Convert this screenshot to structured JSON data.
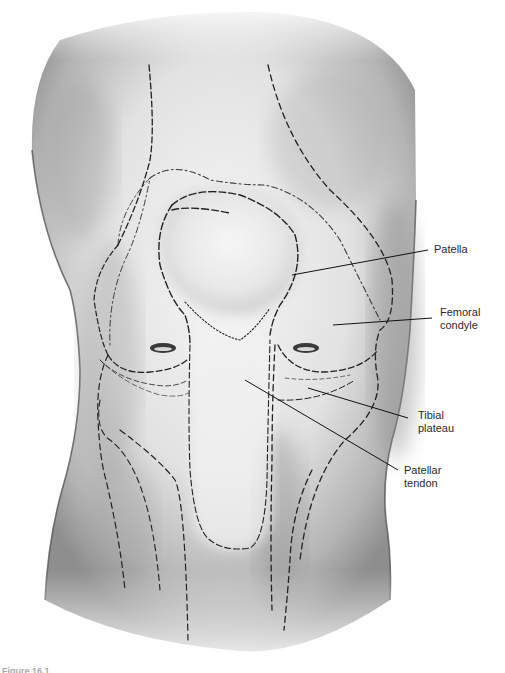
{
  "figure": {
    "caption_partial": "Figure 16.1"
  },
  "labels": [
    {
      "id": "patella",
      "text": "Patella"
    },
    {
      "id": "femoral-condyle",
      "text": "Femoral\ncondyle"
    },
    {
      "id": "tibial-plateau",
      "text": "Tibial\nplateau"
    },
    {
      "id": "patellar-tendon",
      "text": "Patellar\ntendon"
    }
  ],
  "colors": {
    "background": "#ffffff",
    "skin_light": "#f2f2f2",
    "skin_shadow": "#8a8a8a",
    "outline": "#222222",
    "label_text": "#2a2a2a"
  }
}
